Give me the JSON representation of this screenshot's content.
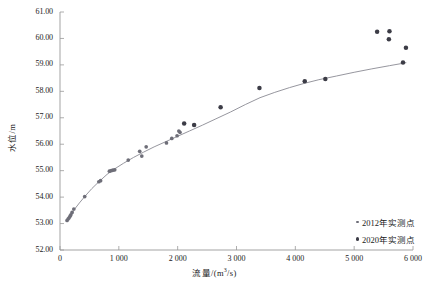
{
  "chart_data": {
    "type": "scatter",
    "title": "",
    "xlabel": "流量/(m³/s)",
    "xlabel_base": "流量/(m",
    "xlabel_sup": "3",
    "xlabel_tail": "/s)",
    "ylabel": "水位/m",
    "xlim": [
      0,
      6000
    ],
    "ylim": [
      52.0,
      61.0
    ],
    "xticks": [
      0,
      1000,
      2000,
      3000,
      4000,
      5000,
      6000
    ],
    "xticklabels": [
      "0",
      "1 000",
      "2 000",
      "3 000",
      "4 000",
      "5 000",
      "6 000"
    ],
    "yticks": [
      52.0,
      53.0,
      54.0,
      55.0,
      56.0,
      57.0,
      58.0,
      59.0,
      60.0,
      61.0
    ],
    "yticklabels": [
      "52.00",
      "53.00",
      "54.00",
      "55.00",
      "56.00",
      "57.00",
      "58.00",
      "59.00",
      "60.00",
      "61.00"
    ],
    "grid": false,
    "legend_position": "lower-right",
    "legend": [
      {
        "name": "2012年实测点",
        "color": "#6e6e78",
        "marker_size": 2.6
      },
      {
        "name": "2020年实测点",
        "color": "#3c3c46",
        "marker_size": 3.4
      }
    ],
    "series": [
      {
        "name": "2012年实测点",
        "color": "#6e6e78",
        "marker_size": 2.6,
        "points": [
          [
            120,
            53.12
          ],
          [
            140,
            53.18
          ],
          [
            155,
            53.22
          ],
          [
            170,
            53.28
          ],
          [
            185,
            53.33
          ],
          [
            205,
            53.42
          ],
          [
            235,
            53.55
          ],
          [
            420,
            54.02
          ],
          [
            660,
            54.58
          ],
          [
            690,
            54.62
          ],
          [
            840,
            54.98
          ],
          [
            870,
            55.0
          ],
          [
            900,
            55.02
          ],
          [
            930,
            55.03
          ],
          [
            1160,
            55.4
          ],
          [
            1355,
            55.73
          ],
          [
            1390,
            55.55
          ],
          [
            1465,
            55.9
          ],
          [
            1810,
            56.05
          ],
          [
            1900,
            56.22
          ],
          [
            1990,
            56.32
          ],
          [
            2020,
            56.5
          ],
          [
            2040,
            56.45
          ]
        ]
      },
      {
        "name": "2020年实测点",
        "color": "#3c3c46",
        "marker_size": 3.4,
        "points": [
          [
            2110,
            56.78
          ],
          [
            2280,
            56.73
          ],
          [
            2730,
            57.4
          ],
          [
            3390,
            58.13
          ],
          [
            4160,
            58.38
          ],
          [
            4510,
            58.47
          ],
          [
            5390,
            60.25
          ],
          [
            5600,
            60.27
          ],
          [
            5590,
            59.97
          ],
          [
            5830,
            59.09
          ],
          [
            5880,
            59.65
          ]
        ]
      }
    ],
    "fit_curve": {
      "name": "水位流量关系曲线",
      "color": "#8a8a93",
      "points": [
        [
          110,
          53.08
        ],
        [
          150,
          53.2
        ],
        [
          200,
          53.38
        ],
        [
          260,
          53.58
        ],
        [
          330,
          53.78
        ],
        [
          420,
          54.02
        ],
        [
          540,
          54.32
        ],
        [
          660,
          54.58
        ],
        [
          800,
          54.86
        ],
        [
          930,
          55.07
        ],
        [
          1080,
          55.28
        ],
        [
          1250,
          55.5
        ],
        [
          1420,
          55.7
        ],
        [
          1600,
          55.9
        ],
        [
          1800,
          56.1
        ],
        [
          2000,
          56.3
        ],
        [
          2200,
          56.5
        ],
        [
          2420,
          56.72
        ],
        [
          2650,
          56.96
        ],
        [
          2900,
          57.22
        ],
        [
          3150,
          57.5
        ],
        [
          3400,
          57.76
        ],
        [
          3650,
          57.96
        ],
        [
          3900,
          58.14
        ],
        [
          4150,
          58.3
        ],
        [
          4400,
          58.44
        ],
        [
          4700,
          58.58
        ],
        [
          5000,
          58.72
        ],
        [
          5300,
          58.85
        ],
        [
          5600,
          58.97
        ],
        [
          5880,
          59.08
        ]
      ]
    }
  }
}
